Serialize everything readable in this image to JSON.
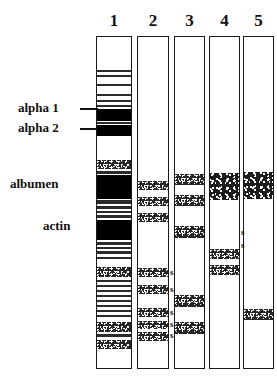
{
  "figure": {
    "background_color": "#ffffff",
    "ink_color": "#000000",
    "width": 277,
    "height": 386
  },
  "lanes": [
    {
      "number": "1",
      "x": 96,
      "y": 36,
      "width": 36,
      "height": 333
    },
    {
      "number": "2",
      "x": 137,
      "y": 36,
      "width": 32,
      "height": 333
    },
    {
      "number": "3",
      "x": 174,
      "y": 36,
      "width": 31,
      "height": 333
    },
    {
      "number": "4",
      "x": 209,
      "y": 36,
      "width": 31,
      "height": 333
    },
    {
      "number": "5",
      "x": 243,
      "y": 36,
      "width": 31,
      "height": 333
    }
  ],
  "annotations": [
    {
      "text": "alpha 1",
      "x": 18,
      "y": 101,
      "leader": {
        "x": 80,
        "y": 108,
        "width": 18
      }
    },
    {
      "text": "alpha 2",
      "x": 18,
      "y": 121,
      "leader": {
        "x": 80,
        "y": 121,
        "width": 18
      }
    },
    {
      "text": "albumen",
      "x": 10,
      "y": 177,
      "leader": null
    },
    {
      "text": "actin",
      "x": 43,
      "y": 219,
      "leader": null
    }
  ],
  "s_marks": [
    {
      "lane": "2",
      "x": 170,
      "y": 268
    },
    {
      "lane": "2",
      "x": 170,
      "y": 285
    },
    {
      "lane": "2",
      "x": 170,
      "y": 308
    },
    {
      "lane": "2",
      "x": 170,
      "y": 320
    },
    {
      "lane": "2",
      "x": 170,
      "y": 331
    },
    {
      "lane": "4",
      "x": 241,
      "y": 228
    },
    {
      "lane": "4",
      "x": 241,
      "y": 241
    }
  ],
  "bands": {
    "lane1": [
      {
        "top": 33,
        "height": 2,
        "style": "thin"
      },
      {
        "top": 38,
        "height": 2,
        "style": "thin"
      },
      {
        "top": 47,
        "height": 2,
        "style": "thin"
      },
      {
        "top": 57,
        "height": 2,
        "style": "thin"
      },
      {
        "top": 63,
        "height": 2,
        "style": "thin"
      },
      {
        "top": 68,
        "height": 2,
        "style": "thin"
      },
      {
        "top": 72,
        "height": 12,
        "style": "solid"
      },
      {
        "top": 85,
        "height": 2,
        "style": "thin"
      },
      {
        "top": 88,
        "height": 11,
        "style": "solid"
      },
      {
        "top": 123,
        "height": 9,
        "style": "speckle"
      },
      {
        "top": 134,
        "height": 3,
        "style": "thin"
      },
      {
        "top": 138,
        "height": 24,
        "style": "solid"
      },
      {
        "top": 163,
        "height": 4,
        "style": "thin"
      },
      {
        "top": 169,
        "height": 3,
        "style": "thin"
      },
      {
        "top": 174,
        "height": 2,
        "style": "thin"
      },
      {
        "top": 178,
        "height": 3,
        "style": "thin"
      },
      {
        "top": 183,
        "height": 20,
        "style": "solid"
      },
      {
        "top": 205,
        "height": 3,
        "style": "thin"
      },
      {
        "top": 210,
        "height": 2,
        "style": "thin"
      },
      {
        "top": 214,
        "height": 3,
        "style": "thin"
      },
      {
        "top": 220,
        "height": 2,
        "style": "thin"
      },
      {
        "top": 230,
        "height": 10,
        "style": "speckle"
      },
      {
        "top": 243,
        "height": 2,
        "style": "thin"
      },
      {
        "top": 248,
        "height": 2,
        "style": "thin"
      },
      {
        "top": 253,
        "height": 2,
        "style": "thin"
      },
      {
        "top": 258,
        "height": 2,
        "style": "thin"
      },
      {
        "top": 263,
        "height": 2,
        "style": "thin"
      },
      {
        "top": 268,
        "height": 2,
        "style": "thin"
      },
      {
        "top": 273,
        "height": 2,
        "style": "thin"
      },
      {
        "top": 278,
        "height": 2,
        "style": "thin"
      },
      {
        "top": 285,
        "height": 10,
        "style": "speckle"
      },
      {
        "top": 297,
        "height": 3,
        "style": "thin"
      },
      {
        "top": 303,
        "height": 9,
        "style": "speckle"
      }
    ],
    "lane2": [
      {
        "top": 144,
        "height": 9,
        "style": "speckle"
      },
      {
        "top": 160,
        "height": 9,
        "style": "speckle"
      },
      {
        "top": 176,
        "height": 9,
        "style": "speckle"
      },
      {
        "top": 231,
        "height": 9,
        "style": "speckle"
      },
      {
        "top": 248,
        "height": 9,
        "style": "speckle"
      },
      {
        "top": 271,
        "height": 9,
        "style": "speckle"
      },
      {
        "top": 284,
        "height": 8,
        "style": "speckle"
      },
      {
        "top": 295,
        "height": 9,
        "style": "speckle"
      }
    ],
    "lane3": [
      {
        "top": 137,
        "height": 11,
        "style": "speckle"
      },
      {
        "top": 158,
        "height": 11,
        "style": "speckle"
      },
      {
        "top": 189,
        "height": 12,
        "style": "speckle"
      },
      {
        "top": 258,
        "height": 12,
        "style": "speckle"
      },
      {
        "top": 285,
        "height": 12,
        "style": "speckle"
      }
    ],
    "lane4": [
      {
        "top": 136,
        "height": 27,
        "style": "speckle-coarse"
      },
      {
        "top": 212,
        "height": 10,
        "style": "speckle"
      },
      {
        "top": 228,
        "height": 10,
        "style": "speckle"
      }
    ],
    "lane5": [
      {
        "top": 135,
        "height": 27,
        "style": "speckle-coarse"
      },
      {
        "top": 272,
        "height": 11,
        "style": "speckle"
      }
    ]
  }
}
